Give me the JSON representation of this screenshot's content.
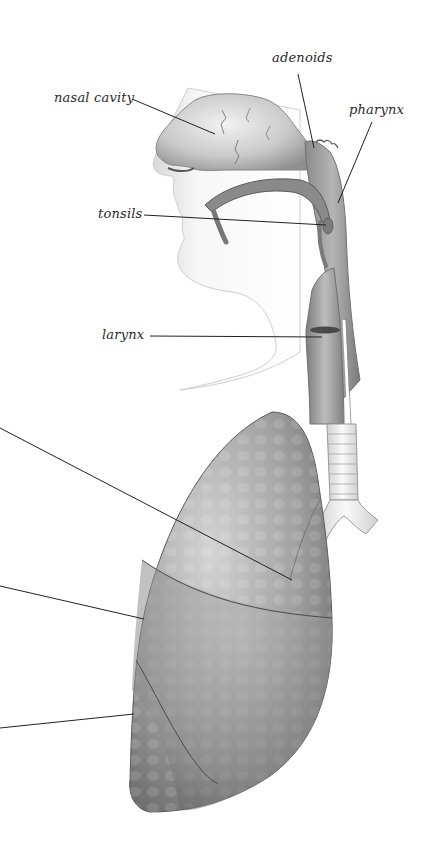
{
  "diagram": {
    "labels": {
      "adenoids": "adenoids",
      "nasal_cavity": "nasal cavity",
      "pharynx": "pharynx",
      "tonsils": "tonsils",
      "larynx": "larynx"
    },
    "unlabeled_leader_lines": 3,
    "colors": {
      "background": "#ffffff",
      "tissue_light": "#e6e6e6",
      "tissue_mid": "#a9a9a9",
      "tissue_dark": "#6e6e6e",
      "leader_line": "#222222"
    }
  }
}
